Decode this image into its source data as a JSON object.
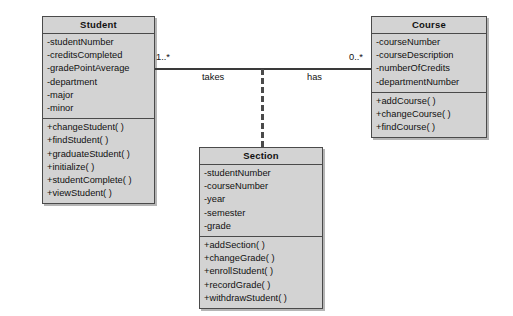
{
  "diagram": {
    "type": "uml-class-diagram",
    "title": "",
    "background_color": "#ffffff",
    "box_fill_color": "#d3d3d3",
    "box_border_color": "#4a4a4a",
    "line_color": "#3a3a3a"
  },
  "classes": [
    {
      "name": "Student",
      "attributes": [
        "-studentNumber",
        "-creditsCompleted",
        "-gradePointAverage",
        "-department",
        "-major",
        "-minor"
      ],
      "operations": [
        "+changeStudent( )",
        "+findStudent( )",
        "+graduateStudent( )",
        "+initialize( )",
        "+studentComplete( )",
        "+viewStudent( )"
      ]
    },
    {
      "name": "Course",
      "attributes": [
        "-courseNumber",
        "-courseDescription",
        "-numberOfCredits",
        "-departmentNumber"
      ],
      "operations": [
        "+addCourse( )",
        "+changeCourse( )",
        "+findCourse( )"
      ]
    },
    {
      "name": "Section",
      "attributes": [
        "-studentNumber",
        "-courseNumber",
        "-year",
        "-semester",
        "-grade"
      ],
      "operations": [
        "+addSection( )",
        "+changeGrade( )",
        "+enrollStudent( )",
        "+recordGrade( )",
        "+withdrawStudent( )"
      ]
    }
  ],
  "association": {
    "source_multiplicity": "1..*",
    "target_multiplicity": "0..*",
    "source_role": "takes",
    "target_role": "has"
  }
}
